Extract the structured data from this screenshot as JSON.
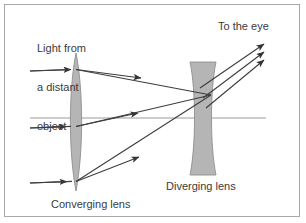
{
  "figure": {
    "background_color": "#ffffff",
    "border_color": "#a9a9a9",
    "ink_color": "#3a3a3a",
    "lens_fill_color": "#b3b3b3",
    "lens_stroke_color": "#8c8c8c",
    "axis_color": "#b9b9b9",
    "ray_color": "#4a4a4a"
  },
  "labels": {
    "light_source": "Light from\na distant\nobject",
    "light_source_lines": [
      "Light from",
      "a distant",
      "object"
    ],
    "to_the_eye": "To the eye",
    "converging_lens": "Converging lens",
    "diverging_lens": "Diverging lens"
  },
  "optics": {
    "optical_axis": {
      "y": 118,
      "x_start": 30,
      "x_end": 266
    },
    "converging_lens": {
      "name": "converging lens",
      "type": "biconvex",
      "center_x": 76,
      "top_y": 53,
      "bottom_y": 191,
      "max_half_width": 7
    },
    "diverging_lens": {
      "name": "diverging lens",
      "type": "biconcave",
      "center_x": 203,
      "top_y": 62,
      "bottom_y": 175,
      "outer_half_width": 13,
      "waist_half_width": 5
    },
    "focal_point": {
      "x": 211,
      "y": 95
    },
    "rays": [
      {
        "id": "ray-upper",
        "entry_y": 70,
        "entry_x": 30,
        "lens_hit_y": 70,
        "focal_x": 211,
        "focal_y": 95,
        "exit_arrow_x": 262,
        "exit_arrow_y": 45
      },
      {
        "id": "ray-middle",
        "entry_y": 127,
        "entry_x": 30,
        "lens_hit_y": 124,
        "focal_x": 211,
        "focal_y": 95,
        "exit_arrow_x": 262,
        "exit_arrow_y": 53
      },
      {
        "id": "ray-lower",
        "entry_y": 182,
        "entry_x": 30,
        "lens_hit_y": 180,
        "focal_x": 211,
        "focal_y": 95,
        "exit_arrow_x": 262,
        "exit_arrow_y": 61
      }
    ],
    "incoming_arrow_positions": [
      {
        "x": 52,
        "y": 69
      },
      {
        "x": 46,
        "y": 127
      },
      {
        "x": 48,
        "y": 182
      }
    ],
    "mid_arrow_positions": [
      {
        "x": 122,
        "y": 74
      },
      {
        "x": 118,
        "y": 112
      },
      {
        "x": 120,
        "y": 154
      }
    ]
  }
}
